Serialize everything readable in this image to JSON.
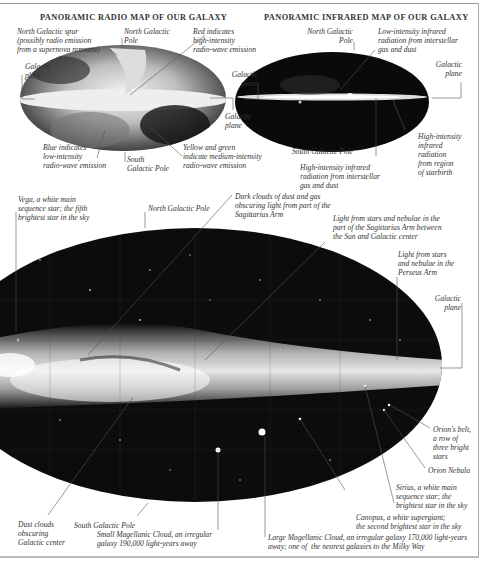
{
  "radio_map": {
    "title": "PANORAMIC RADIO MAP OF OUR GALAXY",
    "labels": {
      "north_galactic_spur": "North Galactic spur\n(possibly radio emission\nfrom a supernova remnant)",
      "north_galactic_pole": "North Galactic\nPole",
      "red_high_intensity": "Red indicates\nhigh-intensity\nradio-wave emission",
      "galactic_plane_left": "Galactic\nplane",
      "galactic_plane_right": "Galactic\nplane",
      "blue_low_intensity": "Blue indicates\nlow-intensity\nradio-wave emission",
      "south_galactic_pole": "South\nGalactic Pole",
      "yellow_green_medium": "Yellow and green\nindicate medium-intensity\nradio-wave emission"
    }
  },
  "infrared_map": {
    "title": "PANORAMIC INFRARED MAP OF OUR GALAXY",
    "labels": {
      "north_galactic_pole": "North Galactic\nPole",
      "low_intensity_infrared": "Low-intensity infrared\nradiation from interstellar\ngas and dust",
      "galactic_plane_left": "Galactic\nplane",
      "galactic_plane_right": "Galactic\nplane",
      "south_galactic_pole": "South Galactic Pole",
      "high_intensity_starbirth": "High-intensity\ninfrared\nradiation\nfrom region\nof starbirth",
      "high_intensity_gas_dust": "High-intensity infrared\nradiation from interstellar\ngas and dust"
    }
  },
  "optical_map": {
    "labels": {
      "vega": "Vega, a white main\nsequence star; the fifth\nbrightest star in the sky",
      "north_galactic_pole": "North Galactic Pole",
      "dark_clouds_sagittarius": "Dark clouds of dust and gas\nobscuring light from part of the\nSagittarius Arm",
      "sagittarius_arm_light": "Light from stars and nebulae in the\npart of the Sagittarius Arm between\nthe Sun and Galactic center",
      "perseus_arm": "Light from stars\nand nebulae in the\nPerseus Arm",
      "galactic_plane": "Galactic\nplane",
      "orions_belt": "Orion's belt,\na row of\nthree bright\nstars",
      "orion_nebula": "Orion Nebula",
      "sirius": "Sirius, a white main\nsequence star; the\nbrightest star in the sky",
      "canopus": "Canopus, a white supergiant;\nthe second brightest star in the sky",
      "dust_clouds_center": "Dust clouds\nobscuring\nGalactic center",
      "south_galactic_pole": "South Galactic Pole",
      "small_magellanic": "Small Magellanic Cloud, an irregular\ngalaxy 190,000 light-years away",
      "large_magellanic": "Large Magellanic Cloud, an irregular galaxy 170,000 light-years\naway; one of  the nearest galaxies to the Milky Way"
    }
  },
  "colors": {
    "map_background": "#101010",
    "galactic_band": "#f2f2f2",
    "leader_line": "#555555",
    "text": "#333333"
  }
}
